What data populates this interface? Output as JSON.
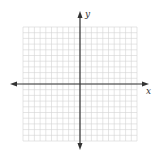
{
  "diagram": {
    "type": "coordinate-plane",
    "x_axis_label": "x",
    "y_axis_label": "y",
    "grid": {
      "cells_x": 20,
      "cells_y": 20,
      "x_range": [
        -10,
        10
      ],
      "y_range": [
        -10,
        10
      ]
    },
    "colors": {
      "axis": "#333333",
      "grid": "#d4d4d4",
      "background": "#ffffff"
    }
  }
}
